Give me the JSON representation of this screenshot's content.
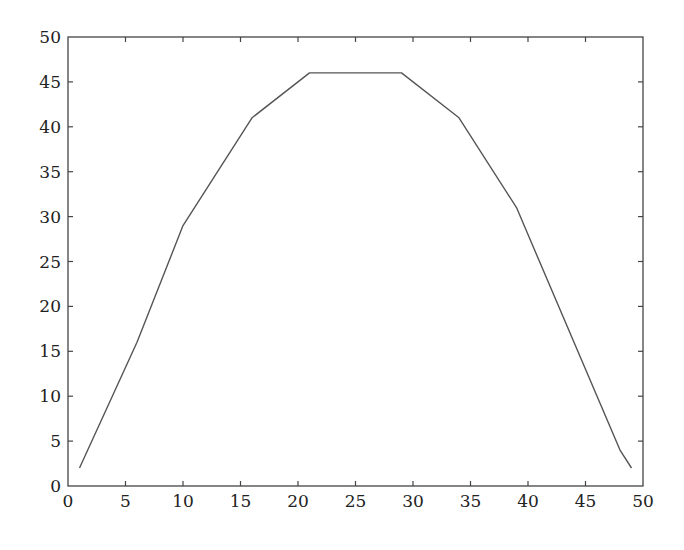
{
  "chart_data": {
    "type": "line",
    "title": "",
    "xlabel": "",
    "ylabel": "",
    "xlim": [
      0,
      50
    ],
    "ylim": [
      0,
      50
    ],
    "grid": false,
    "legend": null,
    "x_ticks": [
      0,
      5,
      10,
      15,
      20,
      25,
      30,
      35,
      40,
      45,
      50
    ],
    "y_ticks": [
      0,
      5,
      10,
      15,
      20,
      25,
      30,
      35,
      40,
      45,
      50
    ],
    "series": [
      {
        "name": "series-1",
        "color": "#555555",
        "x": [
          1,
          6,
          10,
          16,
          21,
          29,
          34,
          39,
          48,
          49
        ],
        "y": [
          2,
          16,
          29,
          41,
          46,
          46,
          41,
          31,
          4,
          2
        ]
      }
    ]
  },
  "colors": {
    "axis": "#444444",
    "line": "#555555",
    "text": "#222222"
  }
}
